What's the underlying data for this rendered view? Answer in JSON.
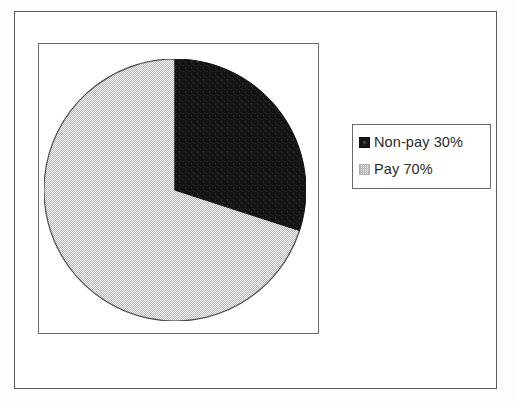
{
  "figure": {
    "background_color": "#fdfdfd",
    "frame_color": "#59595b",
    "plot_frame_color": "#6a6a6c"
  },
  "legend": {
    "position": "right",
    "border_color": "#6a6a6c",
    "entries": [
      {
        "label": "Non-pay 30%",
        "swatch": "dark-solid-swatch",
        "color": "#161616"
      },
      {
        "label": "Pay 70%",
        "swatch": "light-dotted-swatch",
        "color": "#f2f2f2"
      }
    ]
  },
  "chart_data": {
    "type": "pie",
    "title": "",
    "subtitle": "",
    "xlabel": "",
    "ylabel": "",
    "grid": false,
    "legend_position": "right",
    "start_angle_deg": 90,
    "direction": "clockwise",
    "categories": [
      "Non-pay",
      "Pay"
    ],
    "values": [
      30,
      70
    ],
    "value_unit": "%",
    "labels": [
      "Non-pay 30%",
      "Pay 70%"
    ],
    "colors": [
      "#161616",
      "#f2f2f2"
    ],
    "slices": [
      {
        "name": "Non-pay",
        "value": 30,
        "label": "Non-pay 30%",
        "percent": 30,
        "angle_deg": 108,
        "fill": "solid-black",
        "color": "#161616"
      },
      {
        "name": "Pay",
        "value": 70,
        "label": "Pay 70%",
        "percent": 70,
        "angle_deg": 252,
        "fill": "fine-dotted-light-gray",
        "color": "#f2f2f2"
      }
    ]
  }
}
